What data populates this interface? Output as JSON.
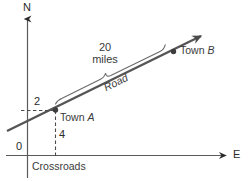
{
  "figure": {
    "kind": "coordinate-diagram",
    "stroke_color": "#555555",
    "axis_color": "#5a5a5a",
    "text_color": "#3a3a3a"
  },
  "axes": {
    "north_label": "N",
    "east_label": "E",
    "origin_label": "0"
  },
  "labels": {
    "north_offset": "2",
    "east_offset": "4",
    "town_a_prefix": "Town ",
    "town_a_letter": "A",
    "town_b_prefix": "Town ",
    "town_b_letter": "B",
    "road": "Road",
    "distance_value": "20",
    "distance_unit": "miles",
    "crossroads": "Crossroads"
  }
}
